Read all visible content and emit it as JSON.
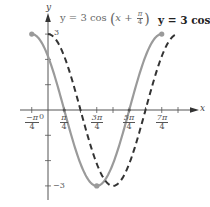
{
  "chart_data": {
    "type": "line",
    "title": "",
    "xlabel": "x",
    "ylabel": "y",
    "xlim": [
      -1.0,
      6.9
    ],
    "ylim": [
      -3.5,
      3.5
    ],
    "grid": false,
    "legend_position": "inline annotations at top",
    "x_ticks": [
      {
        "value": -0.7854,
        "label_num": "−π",
        "label_den": "4"
      },
      {
        "value": 0.7854,
        "label_num": "π",
        "label_den": "4"
      },
      {
        "value": 1.5708,
        "label_num": "",
        "label_den": ""
      },
      {
        "value": 2.3562,
        "label_num": "3π",
        "label_den": "4"
      },
      {
        "value": 3.1416,
        "label_num": "",
        "label_den": ""
      },
      {
        "value": 3.927,
        "label_num": "5π",
        "label_den": "4"
      },
      {
        "value": 4.7124,
        "label_num": "",
        "label_den": ""
      },
      {
        "value": 5.4978,
        "label_num": "7π",
        "label_den": "4"
      },
      {
        "value": 6.2832,
        "label_num": "",
        "label_den": ""
      }
    ],
    "y_ticks": [
      {
        "value": 3,
        "label": "3"
      },
      {
        "value": 2,
        "label": ""
      },
      {
        "value": 1,
        "label": ""
      },
      {
        "value": -1,
        "label": ""
      },
      {
        "value": -2,
        "label": ""
      },
      {
        "value": -3,
        "label": "−3"
      }
    ],
    "origin_label": "0",
    "series": [
      {
        "name": "y = 3 cos (x + π/4)",
        "style": "solid",
        "color": "#9a9a9a",
        "amplitude": 3,
        "phase_shift": -0.7854,
        "x_range": [
          -0.7854,
          5.4978
        ],
        "marked_points": [
          {
            "x": -0.7854,
            "y": 3
          },
          {
            "x": 2.3562,
            "y": -3
          },
          {
            "x": 5.4978,
            "y": 3
          }
        ],
        "zeros": [
          0.7854,
          3.927
        ]
      },
      {
        "name": "y = 3 cos x",
        "style": "dashed",
        "color": "#333333",
        "amplitude": 3,
        "phase_shift": 0,
        "x_range": [
          0,
          6.2832
        ],
        "marked_points": [],
        "zeros": [
          1.5708,
          4.7124
        ]
      }
    ],
    "annotations": [
      {
        "text": "y = 3 cos (x + π/4)",
        "series": 0
      },
      {
        "text": "y = 3 cos x",
        "series": 1
      }
    ]
  },
  "labels": {
    "y_axis": "y",
    "x_axis": "x",
    "origin": "0",
    "y_max": "3",
    "y_min": "−3",
    "eq_shifted_prefix": "y = 3 cos",
    "eq_shifted_var": "x +",
    "eq_shifted_frac_num": "π",
    "eq_shifted_frac_den": "4",
    "eq_base": "y = 3 cos x",
    "tick_neg_pi4_num": "−π",
    "tick_neg_pi4_den": "4",
    "tick_pi4_num": "π",
    "tick_pi4_den": "4",
    "tick_3pi4_num": "3π",
    "tick_3pi4_den": "4",
    "tick_5pi4_num": "5π",
    "tick_5pi4_den": "4",
    "tick_7pi4_num": "7π",
    "tick_7pi4_den": "4"
  },
  "colors": {
    "axis": "#555555",
    "solid_curve": "#9a9a9a",
    "dashed_curve": "#333333",
    "point": "#9a9a9a"
  }
}
